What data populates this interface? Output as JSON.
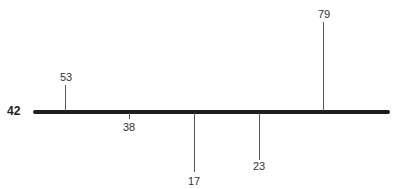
{
  "diagram": {
    "root": {
      "label": "42"
    },
    "main_line": {
      "color": "#1e1e1e"
    },
    "branches": [
      {
        "label": "53",
        "side": "up",
        "length": "short"
      },
      {
        "label": "38",
        "side": "down",
        "length": "tiny"
      },
      {
        "label": "17",
        "side": "down",
        "length": "long"
      },
      {
        "label": "23",
        "side": "down",
        "length": "medium"
      },
      {
        "label": "79",
        "side": "up",
        "length": "long"
      }
    ]
  }
}
